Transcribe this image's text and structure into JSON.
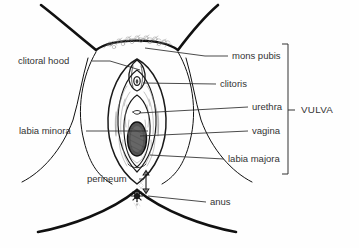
{
  "figure": {
    "type": "anatomical-diagram",
    "background_color": "#fefefe",
    "line_color": "#1a1a1a",
    "text_color": "#333333"
  },
  "labels": {
    "clitoral_hood": "clitoral hood",
    "labia_minora": "labia minora",
    "perineum": "perineum",
    "mons_pubis": "mons pubis",
    "clitoris": "clitoris",
    "urethra": "urethra",
    "vagina": "vagina",
    "labia_majora": "labia majora",
    "anus": "anus",
    "vulva": "VULVA"
  },
  "annotations": [
    {
      "id": "clitoral-hood",
      "text": "clitoral hood",
      "side": "left",
      "text_x": 18,
      "text_y": 61,
      "anchor": "start",
      "leader": [
        [
          92,
          61
        ],
        [
          110,
          61
        ],
        [
          140,
          70
        ]
      ]
    },
    {
      "id": "labia-minora",
      "text": "labia minora",
      "side": "left",
      "text_x": 19,
      "text_y": 131,
      "anchor": "start",
      "leader": [
        [
          86,
          131
        ],
        [
          148,
          131
        ]
      ]
    },
    {
      "id": "perineum",
      "text": "perineum",
      "side": "left",
      "text_x": 87,
      "text_y": 179,
      "anchor": "start",
      "leader": []
    },
    {
      "id": "mons-pubis",
      "text": "mons pubis",
      "side": "right",
      "text_x": 232,
      "text_y": 56,
      "anchor": "start",
      "leader": [
        [
          228,
          56
        ],
        [
          205,
          56
        ],
        [
          145,
          48
        ]
      ]
    },
    {
      "id": "clitoris",
      "text": "clitoris",
      "side": "right",
      "text_x": 220,
      "text_y": 84,
      "anchor": "start",
      "leader": [
        [
          216,
          84
        ],
        [
          143,
          83
        ]
      ]
    },
    {
      "id": "urethra",
      "text": "urethra",
      "side": "right",
      "text_x": 252,
      "text_y": 107,
      "anchor": "start",
      "leader": [
        [
          248,
          107
        ],
        [
          139,
          113
        ]
      ]
    },
    {
      "id": "vagina",
      "text": "vagina",
      "side": "right",
      "text_x": 252,
      "text_y": 131,
      "anchor": "start",
      "leader": [
        [
          248,
          131
        ],
        [
          140,
          136
        ]
      ]
    },
    {
      "id": "labia-majora",
      "text": "labia majora",
      "side": "right",
      "text_x": 228,
      "text_y": 159,
      "anchor": "start",
      "leader": [
        [
          224,
          159
        ],
        [
          150,
          155
        ]
      ]
    },
    {
      "id": "anus",
      "text": "anus",
      "side": "right",
      "text_x": 210,
      "text_y": 202,
      "anchor": "start",
      "leader": [
        [
          206,
          202
        ],
        [
          148,
          196
        ]
      ]
    }
  ],
  "bracket": {
    "label": "VULVA",
    "x": 288,
    "top": 44,
    "bottom": 174,
    "tick_y": 110,
    "tick_length": 7,
    "label_x": 301,
    "label_y": 110
  },
  "perineum_arrow": {
    "x": 146,
    "top_y": 171,
    "bottom_y": 193,
    "double_headed": true
  }
}
